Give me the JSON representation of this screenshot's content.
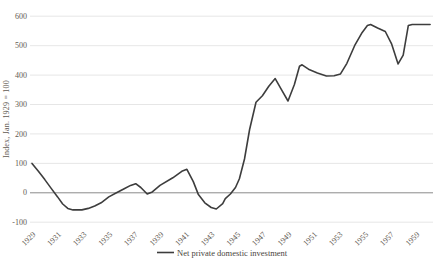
{
  "chart_data": {
    "type": "line",
    "title": "",
    "xlabel": "",
    "ylabel": "Index, Jan. 1929 = 100",
    "x_tick_labels": [
      "1929",
      "1931",
      "1933",
      "1935",
      "1937",
      "1939",
      "1941",
      "1943",
      "1945",
      "1947",
      "1949",
      "1951",
      "1953",
      "1955",
      "1957",
      "1959"
    ],
    "x_ticks": [
      1929,
      1931,
      1933,
      1935,
      1937,
      1939,
      1941,
      1943,
      1945,
      1947,
      1949,
      1951,
      1953,
      1955,
      1957,
      1959
    ],
    "y_ticks": [
      600,
      500,
      400,
      300,
      200,
      100,
      0,
      -100
    ],
    "x_range": [
      1929,
      1960.3
    ],
    "ylim": [
      -100,
      600
    ],
    "grid": "horizontal-only",
    "zero_line": true,
    "legend_position": "bottom-center",
    "series": [
      {
        "name": "Net private domestic investment",
        "color": "#3d3d3d",
        "points": [
          [
            1929.0,
            100
          ],
          [
            1929.5,
            73
          ],
          [
            1930.0,
            45
          ],
          [
            1930.5,
            15
          ],
          [
            1931.0,
            -14
          ],
          [
            1931.4,
            -38
          ],
          [
            1931.8,
            -53
          ],
          [
            1932.2,
            -58
          ],
          [
            1932.9,
            -58
          ],
          [
            1933.4,
            -53
          ],
          [
            1933.9,
            -45
          ],
          [
            1934.4,
            -34
          ],
          [
            1935.0,
            -14
          ],
          [
            1935.6,
            0
          ],
          [
            1936.2,
            14
          ],
          [
            1936.7,
            25
          ],
          [
            1937.1,
            31
          ],
          [
            1937.5,
            18
          ],
          [
            1938.0,
            -4
          ],
          [
            1938.4,
            3
          ],
          [
            1939.0,
            25
          ],
          [
            1940.0,
            51
          ],
          [
            1940.7,
            73
          ],
          [
            1941.1,
            80
          ],
          [
            1941.6,
            38
          ],
          [
            1942.0,
            -6
          ],
          [
            1942.5,
            -34
          ],
          [
            1943.0,
            -50
          ],
          [
            1943.4,
            -55
          ],
          [
            1943.9,
            -37
          ],
          [
            1944.1,
            -20
          ],
          [
            1944.5,
            -4
          ],
          [
            1944.9,
            18
          ],
          [
            1945.2,
            48
          ],
          [
            1945.6,
            115
          ],
          [
            1946.0,
            215
          ],
          [
            1946.5,
            308
          ],
          [
            1947.0,
            330
          ],
          [
            1947.5,
            362
          ],
          [
            1948.0,
            388
          ],
          [
            1948.5,
            350
          ],
          [
            1949.0,
            312
          ],
          [
            1949.5,
            368
          ],
          [
            1949.9,
            430
          ],
          [
            1950.1,
            435
          ],
          [
            1950.6,
            420
          ],
          [
            1951.3,
            407
          ],
          [
            1952.0,
            397
          ],
          [
            1952.6,
            398
          ],
          [
            1953.1,
            404
          ],
          [
            1953.6,
            440
          ],
          [
            1954.2,
            500
          ],
          [
            1954.8,
            545
          ],
          [
            1955.2,
            568
          ],
          [
            1955.45,
            572
          ],
          [
            1956.0,
            560
          ],
          [
            1956.6,
            548
          ],
          [
            1957.1,
            505
          ],
          [
            1957.6,
            438
          ],
          [
            1958.0,
            468
          ],
          [
            1958.4,
            568
          ],
          [
            1958.7,
            572
          ],
          [
            1960.1,
            572
          ]
        ]
      }
    ]
  },
  "legend": {
    "label": "Net private domestic investment"
  },
  "colors": {
    "line": "#3d3d3d",
    "gridline": "#e0e0e0",
    "zero_line": "#8a8a8a",
    "text": "#5f5a52",
    "background": "#ffffff"
  }
}
